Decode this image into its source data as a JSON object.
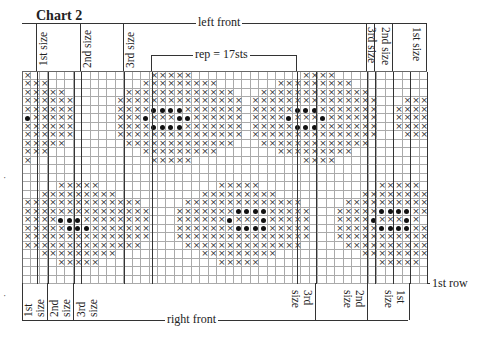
{
  "title": "Chart 2",
  "top_label": "left front",
  "bottom_label": "right front",
  "rep_label": "rep = 17sts",
  "row_label": "1st row",
  "top_size_labels": {
    "left": [
      "1st size",
      "2nd size",
      "3rd size"
    ],
    "right": [
      "3rd size",
      "2nd size",
      "1st size"
    ]
  },
  "bottom_size_labels": {
    "left": [
      "1st size",
      "2nd size",
      "3rd size"
    ],
    "right": [
      "3rd size",
      "2nd size",
      "1st size"
    ]
  },
  "legend": {
    "cross": "×",
    "dot": "●"
  },
  "chart_data": {
    "type": "table",
    "title": "Chart 2",
    "cols": 48,
    "rows": 25,
    "rep_cols": [
      15,
      32
    ],
    "rep_stitches": 17,
    "symbols": {
      "x": "cross stitch",
      "o": "dot stitch",
      ".": "background"
    },
    "grid": [
      "x..............xxxxx.............xxxx...........",
      "xxx...........xxxxxxxxx.......xxxxxxxxx.........",
      "xxxxx.......xxxxxxxxxxxxx...xxxxxxxxxxxxx.......",
      "xxxxxx.....xxxxxxxxxxxxxxx.xxxxxxxxxxxxxxx...xxx",
      "xxxxxx.....xxxxooooxxxxxxx.xxxxxoooxxxxxxx..xxxx",
      "oxxxxx.....xxxoxxxooxxxxxx.xxxxoxxxoxxxxxx..xxxx",
      "xxxxxx.....xxxxooooxxxxxxx.xxxxxoooxxxxxxx..xxxx",
      "xxxxxx.....xxxxxxxxxxxxxxx.xxxxxxxxxxxxxxx...xxx",
      "xxxxx.......xxxxxxxxxxxxx...xxxxxxxxxxxxx.......",
      "xxx...........xxxxxxxxx.......xxxxxxxxx.........",
      "x..............xxxxx.............xxxx...........",
      "................................................",
      "................................................",
      "....xxxxx..............xxxxx..............xxxxx.",
      "..xxxxxxxxx..........xxxxxxxxx..........xxxxxxxx",
      "xxxxxxxxxxxxxx.....xxxxxxxxxxxxxx.....xxxxxxxxxx",
      "xxxxxxxxxxxxxxx...xxxxxxxooooxxxxx...xxxxxooooxx",
      "xxxxoooxxxxxxxx...xxxxxxoxxxoxxxxx...xxxxoxxxox",
      "xxxxxoooxxxxxxx...xxxxxxxooooxxxxx...xxxxxooooxx",
      "xxxxxxxxxxxxxxx...xxxxxxxxxxxxxxxx...xxxxxxxxxxx",
      "xxxxxxxxxxxxxx.....xxxxxxxxxxxxxx.....xxxxxxxxxx",
      "..xxxxxxxxx..........xxxxxxxxx..........xxxxxxxx",
      "....xxxxx..............xxxxx..............xxxxx.",
      "................................................",
      "................................................"
    ]
  }
}
